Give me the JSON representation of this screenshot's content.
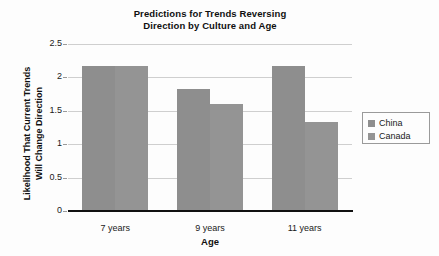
{
  "chart_data": {
    "type": "bar",
    "title": "Predictions for Trends Reversing Direction by Culture and Age",
    "title_lines": [
      "Predictions for Trends Reversing",
      "Direction by Culture and Age"
    ],
    "xlabel": "Age",
    "ylabel": "Likelihood That Current Trends Will Change Direction",
    "ylabel_lines": [
      "Likelihood That Current Trends",
      "Will Change Direction"
    ],
    "categories": [
      "7 years",
      "9 years",
      "11 years"
    ],
    "series": [
      {
        "name": "China",
        "color": "#8e8e8e",
        "values": [
          2.17,
          1.83,
          2.17
        ]
      },
      {
        "name": "Canada",
        "color": "#949494",
        "values": [
          2.17,
          1.6,
          1.33
        ]
      }
    ],
    "ylim": [
      0,
      2.5
    ],
    "yticks": [
      0,
      0.5,
      1,
      1.5,
      2,
      2.5
    ],
    "ytick_labels": [
      "0",
      "0.5",
      "1",
      "1.5",
      "2",
      "2.5"
    ],
    "grid": true,
    "legend_position": "right",
    "legend_entries": [
      "China",
      "Canada"
    ],
    "background_color": "#fdfdfd",
    "gridline_color": "#cfcfcf",
    "axis_color": "#111111"
  }
}
